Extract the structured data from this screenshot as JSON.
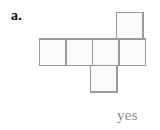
{
  "figure": {
    "problem_label": "a.",
    "answer_text": "yes",
    "background_color": "#ffffff",
    "label_color": "#111111",
    "answer_color": "#8a8a8a"
  },
  "cube_net": {
    "name": "cube-net",
    "stroke_color": "#9a9a9a",
    "fill_color": "#fafafa",
    "stroke_width": 1.5,
    "cell_size": 26.5,
    "origin_x": 39,
    "origin_y": 39,
    "columns": 4,
    "rows": 3,
    "cells": [
      {
        "name": "net-square-top",
        "col": 3,
        "row": 0,
        "x": 116.5,
        "y": 12.5,
        "w": 26.5,
        "h": 26.5
      },
      {
        "name": "net-square-row-1",
        "col": 0,
        "row": 1,
        "x": 39.5,
        "y": 39,
        "w": 26.5,
        "h": 26.5
      },
      {
        "name": "net-square-row-2",
        "col": 1,
        "row": 1,
        "x": 66,
        "y": 39,
        "w": 26.5,
        "h": 26.5
      },
      {
        "name": "net-square-row-3",
        "col": 2,
        "row": 1,
        "x": 92.5,
        "y": 39,
        "w": 26.5,
        "h": 26.5
      },
      {
        "name": "net-square-row-4",
        "col": 3,
        "row": 1,
        "x": 119,
        "y": 39,
        "w": 26.5,
        "h": 26.5
      },
      {
        "name": "net-square-bottom",
        "col": 2,
        "row": 2,
        "x": 90.5,
        "y": 65.5,
        "w": 26.5,
        "h": 26.5
      }
    ]
  },
  "chart_data": {
    "type": "diagram",
    "title": "a.",
    "subtitle": "",
    "annotations": [
      "yes"
    ],
    "shape": "cube net (hexomino)",
    "grid_columns": 4,
    "grid_rows": 3,
    "occupied_cells": [
      [
        3,
        0
      ],
      [
        0,
        1
      ],
      [
        1,
        1
      ],
      [
        2,
        1
      ],
      [
        3,
        1
      ],
      [
        2,
        2
      ]
    ],
    "cell_count": 6,
    "folds_into_cube": true,
    "grid": false,
    "legend": "none"
  }
}
